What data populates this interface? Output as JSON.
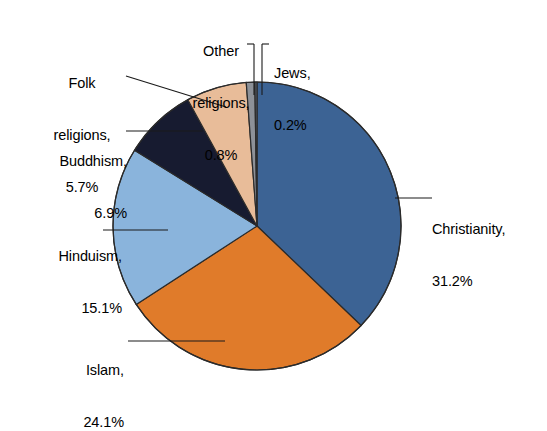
{
  "page": {
    "background": "#ffffff",
    "width": 547,
    "height": 385,
    "cropped_title_fragment": "Religious composition of the world's population"
  },
  "chart_data": {
    "type": "pie",
    "title": "",
    "xlabel": "",
    "ylabel": "",
    "legend_position": "none",
    "labels_style": "callout-with-leader-line",
    "units": "percent",
    "start_angle_deg": 0,
    "direction": "clockwise",
    "categories": [
      "Christianity",
      "Islam",
      "Hinduism",
      "Buddhism",
      "Folk religions",
      "Other religions",
      "Jews"
    ],
    "values": [
      31.2,
      24.1,
      15.1,
      6.9,
      5.7,
      0.8,
      0.2
    ],
    "colors": [
      "#3c6394",
      "#e07b2a",
      "#8ab4dc",
      "#171b30",
      "#e8bc99",
      "#8d9198",
      "#5d6470"
    ],
    "slices": [
      {
        "name": "Christianity",
        "value": 31.2,
        "value_text": "31.2%",
        "color": "#3c6394"
      },
      {
        "name": "Islam",
        "value": 24.1,
        "value_text": "24.1%",
        "color": "#e07b2a"
      },
      {
        "name": "Hinduism",
        "value": 15.1,
        "value_text": "15.1%",
        "color": "#8ab4dc"
      },
      {
        "name": "Buddhism",
        "value": 6.9,
        "value_text": "6.9%",
        "color": "#171b30"
      },
      {
        "name": "Folk religions",
        "value": 5.7,
        "value_text": "5.7%",
        "color": "#e8bc99"
      },
      {
        "name": "Other religions",
        "value": 0.8,
        "value_text": "0.8%",
        "color": "#8d9198"
      },
      {
        "name": "Jews",
        "value": 0.2,
        "value_text": "0.2%",
        "color": "#5d6470"
      }
    ],
    "total_shown": 84.0,
    "geometry": {
      "center_x": 257,
      "center_y": 226,
      "radius": 144,
      "outline_color": "#2b2b2b",
      "outline_width": 1.2
    }
  },
  "labels": {
    "christianity": {
      "line1": "Christianity,",
      "line2": "31.2%"
    },
    "islam": {
      "line1": "Islam,",
      "line2": "24.1%"
    },
    "hinduism": {
      "line1": "Hinduism,",
      "line2": "15.1%"
    },
    "buddhism": {
      "line1": "Buddhism,",
      "line2": "6.9%"
    },
    "folk": {
      "line1": "Folk",
      "line2": "religions,",
      "line3": "5.7%"
    },
    "other": {
      "line1": "Other",
      "line2": "religions,",
      "line3": "0.8%"
    },
    "jews": {
      "line1": "Jews,",
      "line2": "0.2%"
    }
  },
  "leader_lines": {
    "color": "#1a1a1a",
    "width": 1.1
  }
}
